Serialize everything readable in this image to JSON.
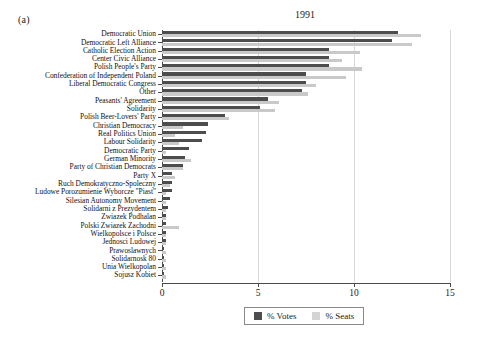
{
  "panel": {
    "label": "(a)"
  },
  "legend": {
    "position": "bottom-center",
    "entries": [
      {
        "name": "% Votes",
        "color": "#4d4d4d"
      },
      {
        "name": "% Seats",
        "color": "#d4d4d4"
      }
    ]
  },
  "axis": {
    "ticks": [
      "0",
      "5",
      "10",
      "15"
    ],
    "tick_values": [
      0,
      5,
      10,
      15
    ]
  },
  "chart_data": {
    "type": "bar",
    "orientation": "horizontal",
    "title": "1991",
    "xlabel": "",
    "ylabel": "",
    "xlim": [
      0,
      15
    ],
    "grid": true,
    "legend_position": "bottom-center",
    "categories": [
      "Democratic Union",
      "Democratic Left Alliance",
      "Catholic Election Action",
      "Center Civic Alliance",
      "Polish People's Party",
      "Confederation of Independent Poland",
      "Liberal Democratic Congress",
      "Other",
      "Peasants' Agreement",
      "Solidarity",
      "Polish Beer-Lovers' Party",
      "Christian Democracy",
      "Real Politics Union",
      "Labour Solidarity",
      "Democratic Party",
      "German Minority",
      "Party of Christian Democrats",
      "Party X",
      "Ruch Demokratyczno-Spoleczny",
      "Ludowe Porozumienie Wyborcze \"Piast\"",
      "Silesian Autonomy Movement",
      "Solidarni z Prezydentem",
      "Zwiazek Podhalan",
      "Polski Zwiazek Zachodni",
      "Wielkopolsce i Polsce",
      "Jednosci Ludowej",
      "Prawoslawnych",
      "Solidarnosk 80",
      "Unia Wielkopolan",
      "Sojusz Kobiet"
    ],
    "series": [
      {
        "name": "% Votes",
        "color": "#4d4d4d",
        "values": [
          12.3,
          12.0,
          8.7,
          8.7,
          8.7,
          7.5,
          7.5,
          7.3,
          5.5,
          5.1,
          3.3,
          2.4,
          2.3,
          2.1,
          1.4,
          1.2,
          1.1,
          0.5,
          0.5,
          0.5,
          0.4,
          0.3,
          0.2,
          0.2,
          0.2,
          0.2,
          0.1,
          0.1,
          0.1,
          0.1
        ]
      },
      {
        "name": "% Seats",
        "color": "#c9c9c9",
        "values": [
          13.5,
          13.0,
          10.3,
          9.4,
          10.4,
          9.6,
          8.0,
          7.6,
          6.1,
          5.9,
          3.5,
          1.1,
          0.7,
          0.9,
          0.2,
          1.5,
          1.1,
          0.7,
          0.4,
          0.2,
          0.2,
          0.2,
          0.2,
          0.9,
          0.2,
          0.2,
          0.2,
          0.2,
          0.2,
          0.2
        ]
      }
    ]
  }
}
